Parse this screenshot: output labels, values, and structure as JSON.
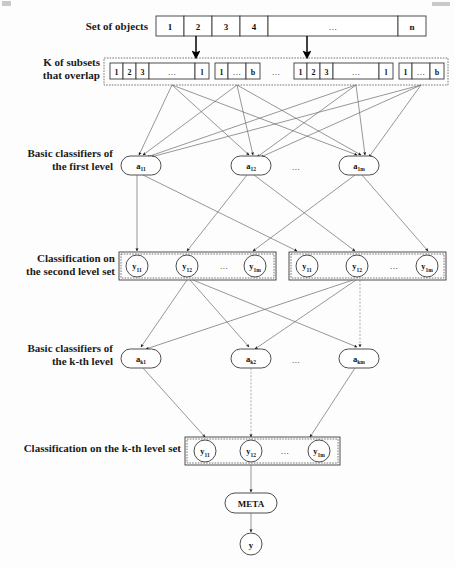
{
  "labels": {
    "set_of_objects": "Set of objects",
    "k_subsets_line1": "K of subsets",
    "k_subsets_line2": "that overlap",
    "basic_first_line1": "Basic classifiers of",
    "basic_first_line2": "the first level",
    "second_level_line1": "Classification on",
    "second_level_line2": "the second level set",
    "basic_kth_line1": "Basic classifiers of",
    "basic_kth_line2": "the k-th level",
    "kth_level_set": "Classification on the k-th level set"
  },
  "object_set": {
    "cells": [
      "1",
      "2",
      "3",
      "4",
      "...",
      "n"
    ]
  },
  "subsets": {
    "groups": [
      {
        "cells": [
          "1",
          "2",
          "3",
          "...",
          "l"
        ]
      },
      {
        "cells": [
          "1",
          "...",
          "b"
        ]
      },
      {
        "cells": [
          "1",
          "2",
          "3",
          "...",
          "l"
        ]
      },
      {
        "cells": [
          "1",
          "...",
          "b"
        ]
      }
    ],
    "separator": "..."
  },
  "first_level_classifiers": {
    "nodes": [
      {
        "base": "a",
        "sub": "11"
      },
      {
        "base": "a",
        "sub": "12"
      },
      {
        "base": "a",
        "sub": "1m"
      }
    ],
    "ellipsis": "..."
  },
  "second_level": {
    "groups": [
      {
        "nodes": [
          {
            "base": "y",
            "sub": "11"
          },
          {
            "base": "y",
            "sub": "12"
          },
          {
            "base": "y",
            "sub": "1m"
          }
        ],
        "ellipsis": "..."
      },
      {
        "nodes": [
          {
            "base": "y",
            "sub": "11"
          },
          {
            "base": "y",
            "sub": "12"
          },
          {
            "base": "y",
            "sub": "1m"
          }
        ],
        "ellipsis": "..."
      }
    ]
  },
  "kth_level_classifiers": {
    "nodes": [
      {
        "base": "a",
        "sub": "k1"
      },
      {
        "base": "a",
        "sub": "k2"
      },
      {
        "base": "a",
        "sub": "km"
      }
    ],
    "ellipsis": "..."
  },
  "kth_level_outputs": {
    "nodes": [
      {
        "base": "y",
        "sub": "11"
      },
      {
        "base": "y",
        "sub": "12"
      },
      {
        "base": "y",
        "sub": "1m"
      }
    ],
    "ellipsis": "..."
  },
  "meta": {
    "label": "META"
  },
  "final_output": {
    "label": "y"
  },
  "colors": {
    "stroke": "#3a3a3a",
    "edge": "#6b6b6b",
    "text": "#111111",
    "background": "#fdfdfd"
  }
}
